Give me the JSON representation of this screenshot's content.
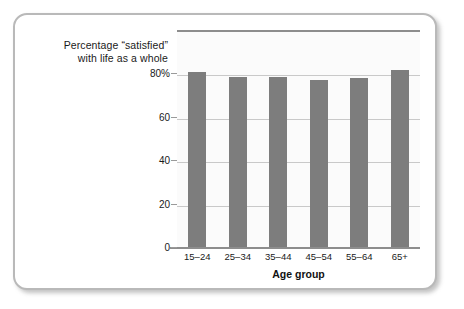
{
  "card": {
    "caption_line1": "Percentage “satisfied”",
    "caption_line2": "with life as a whole"
  },
  "chart_data": {
    "type": "bar",
    "title": "Percentage “satisfied” with life as a whole",
    "xlabel": "Age group",
    "ylabel": "",
    "categories": [
      "15–24",
      "25–34",
      "35–44",
      "45–54",
      "55–64",
      "65+"
    ],
    "values": [
      80.5,
      78,
      78,
      77,
      77.5,
      81.5
    ],
    "ylim": [
      0,
      100
    ],
    "ytick_labels": [
      "80%",
      "60",
      "40",
      "20",
      "0"
    ],
    "ytick_values": [
      80,
      60,
      40,
      20,
      0
    ],
    "grid": true,
    "legend": "none",
    "bar_color": "#7d7d7d",
    "plot_background": "#fbfbfb",
    "axis_color": "#8d8d8d",
    "gridline_color": "#c9c9c9"
  }
}
